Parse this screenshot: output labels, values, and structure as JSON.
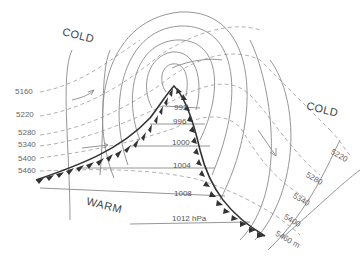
{
  "diagram": {
    "type": "upper-air and surface analysis of a mid-latitude cyclone",
    "air_masses": {
      "cold_nw": "COLD",
      "cold_e": "COLD",
      "warm_sw": "WARM"
    },
    "height_contours_left": [
      "5160",
      "5220",
      "5280",
      "5340",
      "5400",
      "5460"
    ],
    "height_contours_right": [
      "5220",
      "5280",
      "5340",
      "5400",
      "5460 m"
    ],
    "isobars": [
      "992",
      "996",
      "1000",
      "1004",
      "1008",
      "1012 hPa"
    ],
    "legend": {
      "solid_lines": "isobars (hPa)",
      "dashed_lines": "500 hPa heights (m)",
      "barbed_line": "cold front"
    },
    "colors": {
      "isobar": "#888888",
      "height_contour": "#aaaaaa",
      "front": "#333333",
      "text": "#555555"
    }
  }
}
